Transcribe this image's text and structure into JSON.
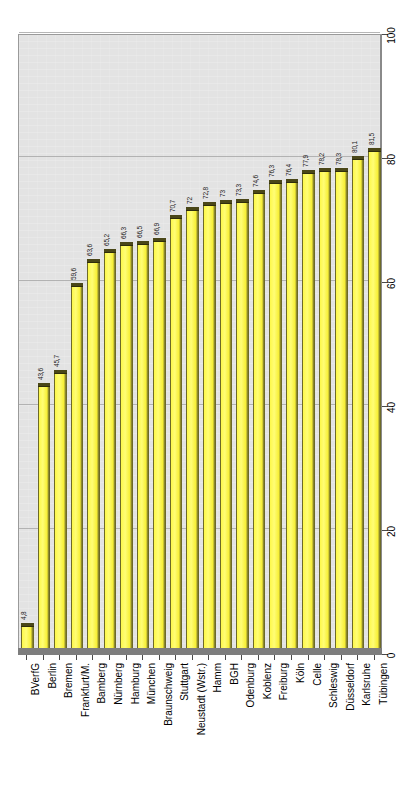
{
  "chart_data": {
    "type": "bar",
    "title": "",
    "subtitle": "",
    "xlabel": "",
    "ylabel": "",
    "ylim": [
      0,
      100
    ],
    "grid": true,
    "legend": false,
    "orientation": "vertical",
    "value_labels_rotated": true,
    "categories": [
      "BVerfG",
      "Berlin",
      "Bremen",
      "Frankfurt/M.",
      "Bamberg",
      "Nürnberg",
      "Hamburg",
      "München",
      "Braunschweig",
      "Stuttgart",
      "Neustadt (Wstr.)",
      "Hamm",
      "BGH",
      "Odenburg",
      "Koblenz",
      "Freiburg",
      "Köln",
      "Celle",
      "Schleswig",
      "Düsseldorf",
      "Karlsruhe",
      "Tübingen"
    ],
    "values": [
      4.8,
      43.6,
      45.7,
      59.6,
      63.6,
      65.2,
      66.3,
      66.5,
      66.9,
      70.7,
      72,
      72.8,
      73,
      73.3,
      74.6,
      76.3,
      76.4,
      77.9,
      78.2,
      78.3,
      80.1,
      81.5
    ],
    "value_labels": [
      "4,8",
      "43,6",
      "45,7",
      "59,6",
      "63,6",
      "65,2",
      "66,3",
      "66,5",
      "66,9",
      "70,7",
      "72",
      "72,8",
      "73",
      "73,3",
      "74,6",
      "76,3",
      "76,4",
      "77,9",
      "78,2",
      "78,3",
      "80,1",
      "81,5"
    ],
    "y_ticks": [
      0,
      20,
      40,
      60,
      80,
      100
    ],
    "y_tick_labels": [
      "0",
      "20",
      "40",
      "60",
      "80",
      "100"
    ],
    "colors": {
      "bar_fill": "#fdf84a",
      "bar_highlight": "#fffd76",
      "bar_edge": "#6d6a28",
      "bar_cap": "#4a4718",
      "plot_background": "#e3e3e3",
      "gridline": "#a9a9a9",
      "axis": "#4a4a4a",
      "floor": "#7d7d7d",
      "text": "#000000"
    }
  }
}
